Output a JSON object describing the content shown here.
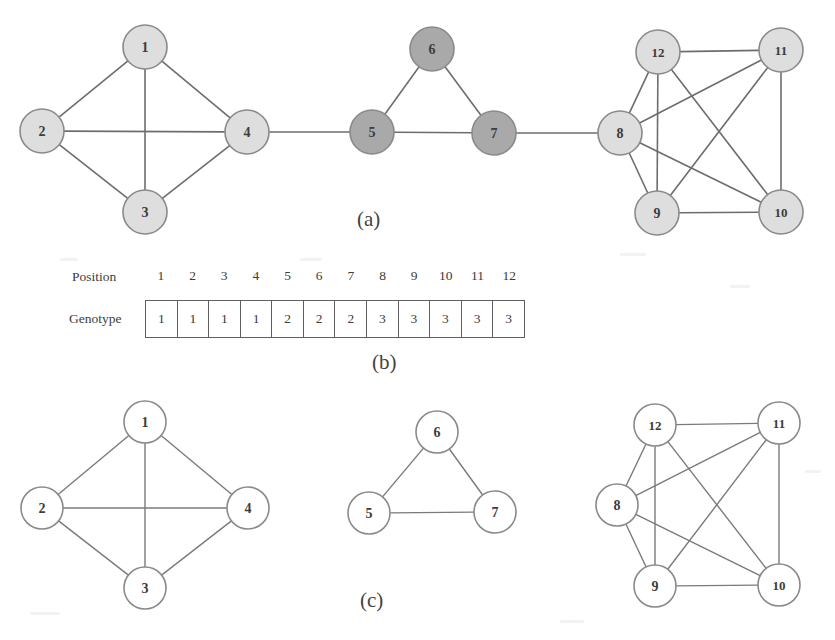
{
  "figure": {
    "captions": [
      {
        "id": "panel-a",
        "label": "(a)",
        "x": 357,
        "y": 207
      },
      {
        "id": "panel-b",
        "label": "(b)",
        "x": 372,
        "y": 350
      },
      {
        "id": "panel-c",
        "label": "(c)",
        "x": 360,
        "y": 588
      }
    ]
  },
  "colors": {
    "node_light": "#dedede",
    "node_medium": "#a9a9a9",
    "node_white": "#ffffff",
    "node_stroke": "#8a8a8a",
    "edge": "#6d6d6d",
    "text": "#3c3c3c",
    "table_border": "#5f5f5f",
    "background": "#ffffff"
  },
  "panel_a": {
    "name": "original-network",
    "nodes": [
      {
        "id": "1",
        "label": "1",
        "x": 145,
        "y": 47,
        "r": 22,
        "fill": "#dedede",
        "cluster": 1
      },
      {
        "id": "2",
        "label": "2",
        "x": 42,
        "y": 131,
        "r": 22,
        "fill": "#dedede",
        "cluster": 1
      },
      {
        "id": "3",
        "label": "3",
        "x": 145,
        "y": 212,
        "r": 22,
        "fill": "#dedede",
        "cluster": 1
      },
      {
        "id": "4",
        "label": "4",
        "x": 247,
        "y": 132,
        "r": 22,
        "fill": "#dedede",
        "cluster": 1
      },
      {
        "id": "5",
        "label": "5",
        "x": 372,
        "y": 132,
        "r": 22,
        "fill": "#a9a9a9",
        "cluster": 2
      },
      {
        "id": "6",
        "label": "6",
        "x": 432,
        "y": 49,
        "r": 22,
        "fill": "#a9a9a9",
        "cluster": 2
      },
      {
        "id": "7",
        "label": "7",
        "x": 494,
        "y": 133,
        "r": 22,
        "fill": "#a9a9a9",
        "cluster": 2
      },
      {
        "id": "8",
        "label": "8",
        "x": 620,
        "y": 133,
        "r": 22,
        "fill": "#dedede",
        "cluster": 3
      },
      {
        "id": "9",
        "label": "9",
        "x": 657,
        "y": 213,
        "r": 22,
        "fill": "#dedede",
        "cluster": 3
      },
      {
        "id": "10",
        "label": "10",
        "x": 781,
        "y": 212,
        "r": 22,
        "fill": "#dedede",
        "cluster": 3
      },
      {
        "id": "11",
        "label": "11",
        "x": 781,
        "y": 50,
        "r": 22,
        "fill": "#dedede",
        "cluster": 3
      },
      {
        "id": "12",
        "label": "12",
        "x": 658,
        "y": 52,
        "r": 22,
        "fill": "#dedede",
        "cluster": 3
      }
    ],
    "edges": [
      [
        "1",
        "2"
      ],
      [
        "1",
        "3"
      ],
      [
        "1",
        "4"
      ],
      [
        "2",
        "3"
      ],
      [
        "2",
        "4"
      ],
      [
        "3",
        "4"
      ],
      [
        "4",
        "5"
      ],
      [
        "5",
        "6"
      ],
      [
        "5",
        "7"
      ],
      [
        "6",
        "7"
      ],
      [
        "7",
        "8"
      ],
      [
        "8",
        "9"
      ],
      [
        "8",
        "10"
      ],
      [
        "8",
        "11"
      ],
      [
        "8",
        "12"
      ],
      [
        "9",
        "10"
      ],
      [
        "9",
        "11"
      ],
      [
        "9",
        "12"
      ],
      [
        "10",
        "11"
      ],
      [
        "10",
        "12"
      ],
      [
        "11",
        "12"
      ]
    ]
  },
  "panel_b": {
    "name": "genotype-encoding",
    "position_label": "Position",
    "genotype_label": "Genotype",
    "positions": [
      "1",
      "2",
      "3",
      "4",
      "5",
      "6",
      "7",
      "8",
      "9",
      "10",
      "11",
      "12"
    ],
    "genotype": [
      "1",
      "1",
      "1",
      "1",
      "2",
      "2",
      "2",
      "3",
      "3",
      "3",
      "3",
      "3"
    ]
  },
  "panel_c": {
    "name": "decoded-communities",
    "clusters": [
      {
        "id": "cluster-1",
        "nodes": [
          {
            "id": "1",
            "label": "1",
            "x": 145,
            "y": 422,
            "r": 21,
            "fill": "#ffffff"
          },
          {
            "id": "2",
            "label": "2",
            "x": 42,
            "y": 508,
            "r": 21,
            "fill": "#ffffff"
          },
          {
            "id": "3",
            "label": "3",
            "x": 145,
            "y": 588,
            "r": 21,
            "fill": "#ffffff"
          },
          {
            "id": "4",
            "label": "4",
            "x": 248,
            "y": 508,
            "r": 21,
            "fill": "#ffffff"
          }
        ],
        "edges": [
          [
            "1",
            "2"
          ],
          [
            "1",
            "3"
          ],
          [
            "1",
            "4"
          ],
          [
            "2",
            "3"
          ],
          [
            "2",
            "4"
          ],
          [
            "3",
            "4"
          ]
        ]
      },
      {
        "id": "cluster-2",
        "nodes": [
          {
            "id": "6",
            "label": "6",
            "x": 437,
            "y": 432,
            "r": 21,
            "fill": "#ffffff"
          },
          {
            "id": "5",
            "label": "5",
            "x": 369,
            "y": 513,
            "r": 21,
            "fill": "#ffffff"
          },
          {
            "id": "7",
            "label": "7",
            "x": 495,
            "y": 512,
            "r": 21,
            "fill": "#ffffff"
          }
        ],
        "edges": [
          [
            "5",
            "6"
          ],
          [
            "6",
            "7"
          ],
          [
            "5",
            "7"
          ]
        ]
      },
      {
        "id": "cluster-3",
        "nodes": [
          {
            "id": "12",
            "label": "12",
            "x": 655,
            "y": 425,
            "r": 21,
            "fill": "#ffffff"
          },
          {
            "id": "11",
            "label": "11",
            "x": 779,
            "y": 423,
            "r": 21,
            "fill": "#ffffff"
          },
          {
            "id": "8",
            "label": "8",
            "x": 617,
            "y": 505,
            "r": 21,
            "fill": "#ffffff"
          },
          {
            "id": "9",
            "label": "9",
            "x": 655,
            "y": 586,
            "r": 21,
            "fill": "#ffffff"
          },
          {
            "id": "10",
            "label": "10",
            "x": 779,
            "y": 585,
            "r": 21,
            "fill": "#ffffff"
          }
        ],
        "edges": [
          [
            "8",
            "9"
          ],
          [
            "8",
            "10"
          ],
          [
            "8",
            "11"
          ],
          [
            "8",
            "12"
          ],
          [
            "9",
            "10"
          ],
          [
            "9",
            "11"
          ],
          [
            "9",
            "12"
          ],
          [
            "10",
            "11"
          ],
          [
            "10",
            "12"
          ],
          [
            "11",
            "12"
          ]
        ]
      }
    ]
  }
}
